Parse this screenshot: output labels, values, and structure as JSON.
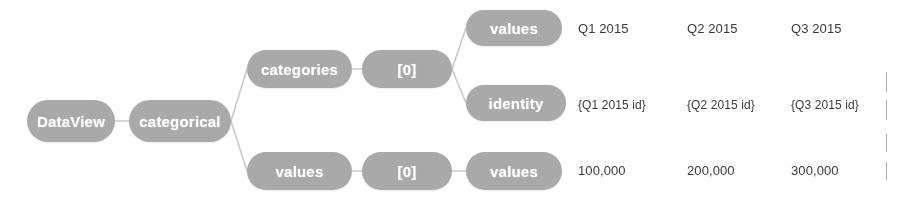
{
  "diagram": {
    "type": "tree",
    "root_label": "DataView",
    "colors": {
      "node_fill": "#a9a9a9",
      "node_text": "#ffffff",
      "leaf_text": "#3a3a3a",
      "edge": "#c9c9c9",
      "background": "#ffffff"
    },
    "nodes": {
      "dataview": "DataView",
      "categorical": "categorical",
      "categories": "categories",
      "categories_index": "[0]",
      "categories_values": "values",
      "categories_identity": "identity",
      "values": "values",
      "values_index": "[0]",
      "values_values": "values"
    },
    "rows": [
      {
        "key": "categories_values",
        "node_label": "values",
        "cells": [
          "Q1 2015",
          "Q2 2015",
          "Q3 2015"
        ]
      },
      {
        "key": "categories_identity",
        "node_label": "identity",
        "cells": [
          "{Q1 2015 id}",
          "{Q2 2015 id}",
          "{Q3 2015 id}"
        ]
      },
      {
        "key": "values_values",
        "node_label": "values",
        "cells": [
          "100,000",
          "200,000",
          "300,000"
        ]
      }
    ]
  }
}
